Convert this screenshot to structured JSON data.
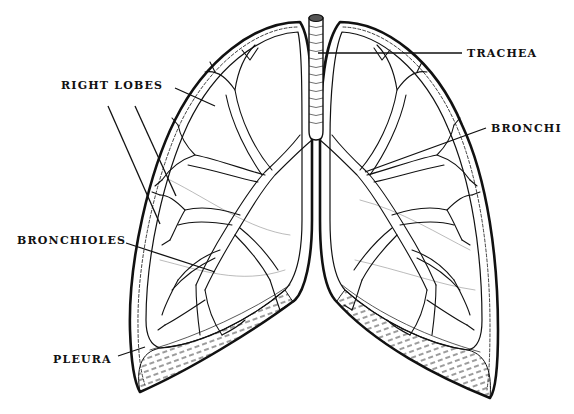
{
  "diagram": {
    "colors": {
      "ink": "#111111",
      "background": "#ffffff",
      "trachea_lumen": "#555555"
    },
    "labels": {
      "trachea": "TRACHEA",
      "right_lobes": "RIGHT LOBES",
      "bronchi": "BRONCHI",
      "bronchioles": "BRONCHIOLES",
      "pleura": "PLEURA"
    }
  }
}
